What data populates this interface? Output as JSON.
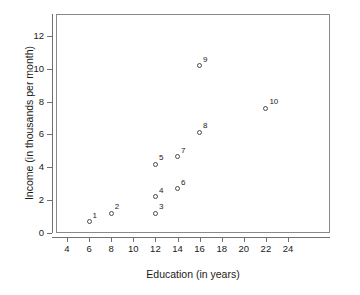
{
  "chart_data": {
    "type": "scatter",
    "title": "",
    "xlabel": "Education (in years)",
    "ylabel": "Income (in thousands per month)",
    "xlim": [
      3,
      25
    ],
    "ylim": [
      0,
      13.3
    ],
    "grid": false,
    "legend": "none",
    "xticks": [
      4,
      6,
      8,
      10,
      12,
      14,
      16,
      18,
      20,
      22,
      24
    ],
    "xtick_labels": [
      "4",
      "6",
      "8",
      "10",
      "12",
      "14",
      "16",
      "18",
      "20",
      "22",
      "24"
    ],
    "yticks": [
      0,
      2,
      4,
      6,
      8,
      10,
      12
    ],
    "ytick_labels": [
      "0",
      "2",
      "4",
      "6",
      "8",
      "10",
      "12"
    ],
    "point_label_position": "upper-right",
    "marker": "open-circle",
    "points": [
      {
        "label": "1",
        "x": 6,
        "y": 0.7
      },
      {
        "label": "2",
        "x": 8,
        "y": 1.2
      },
      {
        "label": "3",
        "x": 12,
        "y": 1.2
      },
      {
        "label": "4",
        "x": 12,
        "y": 2.2
      },
      {
        "label": "5",
        "x": 12,
        "y": 4.2
      },
      {
        "label": "6",
        "x": 14,
        "y": 2.7
      },
      {
        "label": "7",
        "x": 14,
        "y": 4.65
      },
      {
        "label": "8",
        "x": 16,
        "y": 6.15
      },
      {
        "label": "9",
        "x": 16,
        "y": 10.2
      },
      {
        "label": "10",
        "x": 22,
        "y": 7.6
      }
    ]
  },
  "style": {
    "axis_color": "#707070",
    "frame_color": "#8a8a8a",
    "marker_color": "#4a4a4a",
    "text_color": "#1a1a1a",
    "background": "#ffffff"
  }
}
